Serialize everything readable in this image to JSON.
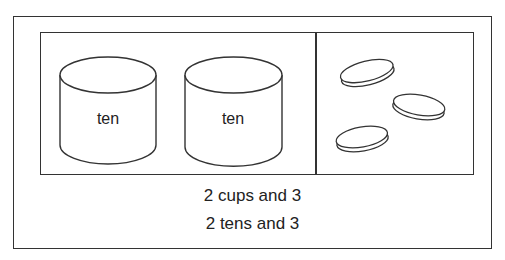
{
  "diagram": {
    "left_panel": {
      "cups": [
        {
          "label": "ten"
        },
        {
          "label": "ten"
        }
      ]
    },
    "right_panel": {
      "ones_count": 3,
      "items": [
        "disc",
        "disc",
        "disc"
      ]
    },
    "captions": [
      "2 cups and 3",
      "2 tens and 3"
    ],
    "colors": {
      "stroke": "#333333",
      "background": "#ffffff"
    }
  }
}
